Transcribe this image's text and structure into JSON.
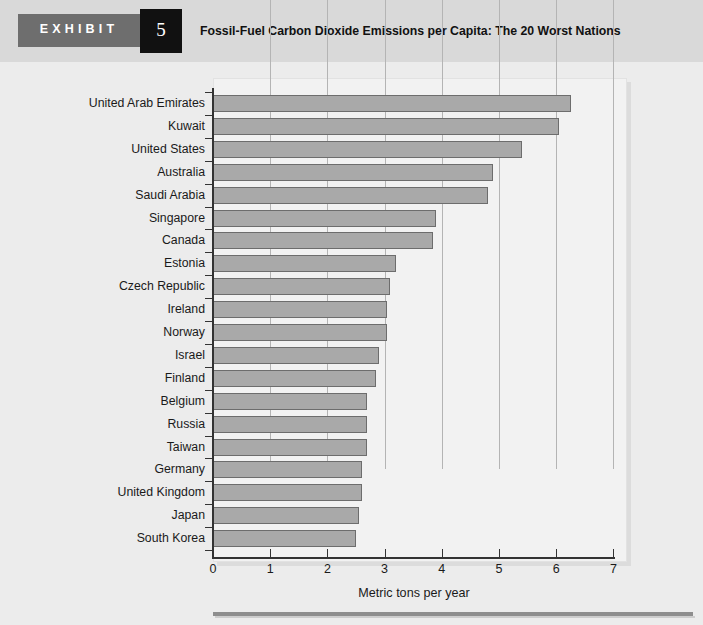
{
  "header": {
    "exhibit_label": "EXHIBIT",
    "exhibit_number": "5",
    "title": "Fossil-Fuel Carbon Dioxide Emissions per Capita: The 20 Worst Nations"
  },
  "colors": {
    "bar_fill": "#a9a9a9",
    "bar_border": "#6d6d6d",
    "header_band": "#d9d9d9",
    "badge": "#6e6e6e",
    "number_box": "#111111",
    "page_background": "#ececec",
    "panel_background": "#f2f2f2",
    "axis": "#333333",
    "gridline": "#b4b4b4",
    "bottom_rule": "#8e8e8e"
  },
  "chart_data": {
    "type": "bar",
    "orientation": "horizontal",
    "title": "Fossil-Fuel Carbon Dioxide Emissions per Capita: The 20 Worst Nations",
    "xlabel": "Metric tons per year",
    "ylabel": "",
    "xlim": [
      0,
      7.2
    ],
    "xticks": [
      0,
      1,
      2,
      3,
      4,
      5,
      6,
      7
    ],
    "xticklabels": [
      "0",
      "1",
      "2",
      "3",
      "4",
      "5",
      "6",
      "7"
    ],
    "grid": "vertical",
    "legend": null,
    "categories": [
      "United Arab Emirates",
      "Kuwait",
      "United States",
      "Australia",
      "Saudi Arabia",
      "Singapore",
      "Canada",
      "Estonia",
      "Czech Republic",
      "Ireland",
      "Norway",
      "Israel",
      "Finland",
      "Belgium",
      "Russia",
      "Taiwan",
      "Germany",
      "United Kingdom",
      "Japan",
      "South Korea"
    ],
    "values": [
      6.25,
      6.05,
      5.4,
      4.9,
      4.8,
      3.9,
      3.85,
      3.2,
      3.1,
      3.05,
      3.05,
      2.9,
      2.85,
      2.7,
      2.7,
      2.7,
      2.6,
      2.6,
      2.55,
      2.5
    ]
  }
}
